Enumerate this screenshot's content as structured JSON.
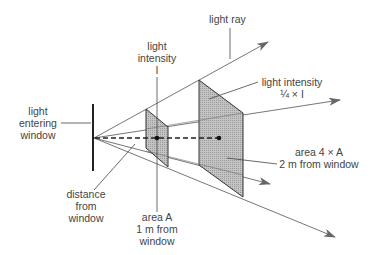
{
  "diagram": {
    "labels": {
      "light_ray": "light ray",
      "light_intensity_near": [
        "light",
        "intensity",
        "I"
      ],
      "light_entering_window": [
        "light",
        "entering",
        "window"
      ],
      "light_intensity_far": [
        "light intensity",
        "¼ × I"
      ],
      "area_far": [
        "area 4 × A",
        "2 m from window"
      ],
      "distance_from_window": [
        "distance",
        "from",
        "window"
      ],
      "area_near": [
        "area A",
        "1 m from",
        "window"
      ]
    },
    "colors": {
      "line": "#555555",
      "panel_fill": "#b8b8b8",
      "panel_edge": "#333333",
      "text": "#444444"
    }
  }
}
